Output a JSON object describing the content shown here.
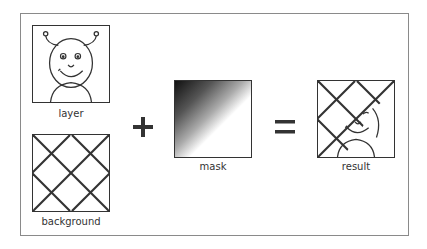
{
  "diagram": {
    "panels": [
      {
        "id": "layer",
        "label": "layer"
      },
      {
        "id": "background",
        "label": "background"
      },
      {
        "id": "mask",
        "label": "mask"
      },
      {
        "id": "result",
        "label": "result"
      }
    ],
    "operators": {
      "plus": "+",
      "equals": "="
    },
    "colors": {
      "stroke": "#333333",
      "frame": "#8a8a8a",
      "mask_dark": "#111111",
      "mask_light": "#ffffff"
    }
  }
}
